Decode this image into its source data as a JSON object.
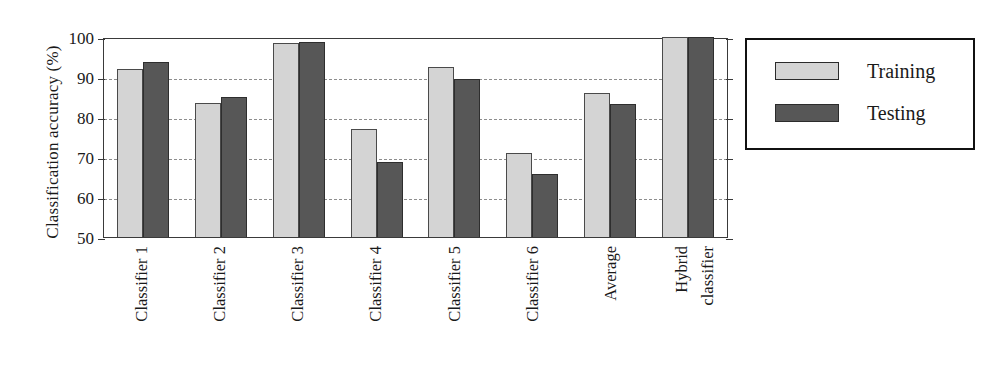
{
  "chart_data": {
    "type": "bar",
    "title": "",
    "xlabel": "",
    "ylabel": "Classification accuracy (%)",
    "ylim": [
      50,
      100
    ],
    "yticks": [
      100,
      90,
      80,
      70,
      60,
      50
    ],
    "ytick_labels": [
      "100",
      "90",
      "80",
      "70",
      "60",
      "50"
    ],
    "grid": "horizontal-dashed",
    "legend_position": "right-outside",
    "categories": [
      "Classifier 1",
      "Classifier 2",
      "Classifier 3",
      "Classifier 4",
      "Classifier 5",
      "Classifier 6",
      "Average",
      "Hybrid classifier"
    ],
    "series": [
      {
        "name": "Training",
        "color": "#d4d4d4",
        "values": [
          92.0,
          83.5,
          98.5,
          77.0,
          92.5,
          71.0,
          86.0,
          100.0
        ]
      },
      {
        "name": "Testing",
        "color": "#575757",
        "values": [
          93.8,
          85.0,
          98.7,
          68.8,
          89.5,
          65.7,
          83.3,
          100.0
        ]
      }
    ]
  },
  "legend": {
    "entries": [
      {
        "label": "Training",
        "swatch": "training"
      },
      {
        "label": "Testing",
        "swatch": "testing"
      }
    ]
  },
  "xlabel_lines": [
    [
      "Classifier 1"
    ],
    [
      "Classifier 2"
    ],
    [
      "Classifier 3"
    ],
    [
      "Classifier 4"
    ],
    [
      "Classifier 5"
    ],
    [
      "Classifier 6"
    ],
    [
      "Average"
    ],
    [
      "Hybrid",
      "classifier"
    ]
  ],
  "colors": {
    "training_fill": "#d4d4d4",
    "testing_fill": "#575757",
    "axis": "#3a3a3a",
    "gridline": "#8d8d8d",
    "legend_border": "#111111",
    "text": "#1a1a1a"
  }
}
